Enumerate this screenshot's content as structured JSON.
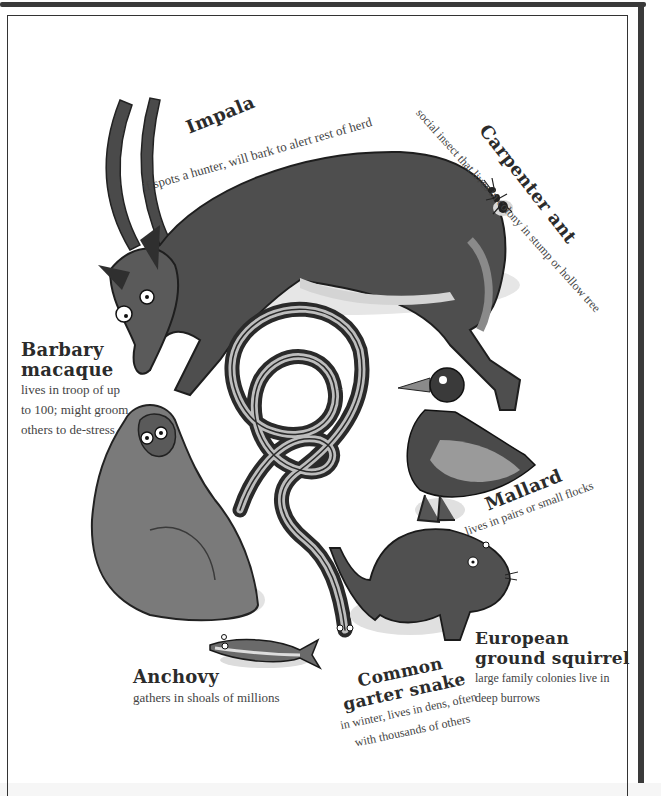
{
  "page": {
    "palette": {
      "background": "#ffffff",
      "ink": "#2b2b2b",
      "dark_fill": "#4a4a4a",
      "mid_fill": "#7a7a7a",
      "light_fill": "#b8b8b8",
      "shadow": "#dcdcdc"
    },
    "animals": [
      {
        "id": "impala",
        "name": "Impala",
        "description": "if spots a hunter, will bark to alert rest of herd",
        "icon": "impala-illustration"
      },
      {
        "id": "carpenter-ant",
        "name": "Carpenter ant",
        "description": "social insect that lives in colony in stump or hollow tree",
        "icon": "ant-illustration"
      },
      {
        "id": "barbary-macaque",
        "name_line1": "Barbary",
        "name_line2": "macaque",
        "description_lines": [
          "lives in troop of up",
          "to 100; might groom",
          "others to de-stress"
        ],
        "icon": "macaque-illustration"
      },
      {
        "id": "mallard",
        "name": "Mallard",
        "description": "lives in pairs or small flocks",
        "icon": "duck-illustration"
      },
      {
        "id": "anchovy",
        "name": "Anchovy",
        "description": "gathers in shoals of millions",
        "icon": "fish-illustration"
      },
      {
        "id": "common-garter-snake",
        "name_line1": "Common",
        "name_line2": "garter snake",
        "description_lines": [
          "in winter, lives in dens, often",
          "with thousands of others"
        ],
        "icon": "snake-illustration"
      },
      {
        "id": "european-ground-squirrel",
        "name_line1": "European",
        "name_line2": "ground squirrel",
        "description_lines": [
          "large family colonies live in",
          "deep burrows"
        ],
        "icon": "squirrel-illustration"
      }
    ]
  }
}
